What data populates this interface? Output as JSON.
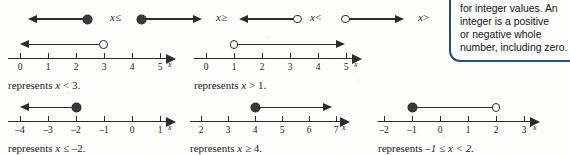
{
  "key": {
    "items": [
      {
        "id": "less-equal",
        "label_var": "x",
        "label_op": "≤",
        "endpoint": "filled",
        "direction": "left"
      },
      {
        "id": "greater-equal",
        "label_var": "x",
        "label_op": "≥",
        "endpoint": "filled",
        "direction": "right"
      },
      {
        "id": "less-than",
        "label_var": "x",
        "label_op": "<",
        "endpoint": "open",
        "direction": "left"
      },
      {
        "id": "greater-than",
        "label_var": "x",
        "label_op": ">",
        "endpoint": "open",
        "direction": "right"
      }
    ]
  },
  "number_lines": [
    {
      "id": "line-x-lt-3",
      "axis_label": "x",
      "ticks": [
        "0",
        "1",
        "2",
        "3",
        "4",
        "5"
      ],
      "endpoint_value": "3",
      "endpoint_type": "open",
      "direction": "left",
      "caption_prefix": "represents ",
      "caption_var": "x",
      "caption_op": " < ",
      "caption_value": "3."
    },
    {
      "id": "line-x-gt-1",
      "axis_label": "x",
      "ticks": [
        "0",
        "1",
        "2",
        "3",
        "4",
        "5"
      ],
      "endpoint_value": "1",
      "endpoint_type": "open",
      "direction": "right",
      "caption_prefix": "represents ",
      "caption_var": "x",
      "caption_op": " > ",
      "caption_value": "1."
    },
    {
      "id": "line-x-le-neg2",
      "axis_label": "x",
      "ticks": [
        "–4",
        "–3",
        "–2",
        "–1",
        "0",
        "1"
      ],
      "endpoint_value": "–2",
      "endpoint_type": "filled",
      "direction": "left",
      "caption_prefix": "represents ",
      "caption_var": "x",
      "caption_op": " ≤ ",
      "caption_value": "–2."
    },
    {
      "id": "line-x-ge-4",
      "axis_label": "x",
      "ticks": [
        "2",
        "3",
        "4",
        "5",
        "6",
        "7"
      ],
      "endpoint_value": "4",
      "endpoint_type": "filled",
      "direction": "right",
      "caption_prefix": "represents ",
      "caption_var": "x",
      "caption_op": " ≥ ",
      "caption_value": "4."
    },
    {
      "id": "line-neg1-le-x-lt-2",
      "axis_label": "x",
      "ticks": [
        "–2",
        "–1",
        "0",
        "1",
        "2",
        "3"
      ],
      "endpoint_value": "–1",
      "endpoint_type": "filled",
      "endpoint2_value": "2",
      "endpoint2_type": "open",
      "direction": "segment",
      "caption_prefix": "represents ",
      "caption_value": "–1 ≤ x < 2."
    }
  ],
  "note": {
    "lines": [
      "for integer values. An",
      "integer is a positive",
      "or negative whole",
      "number, including zero."
    ],
    "border_color": "#1d4f8c"
  }
}
